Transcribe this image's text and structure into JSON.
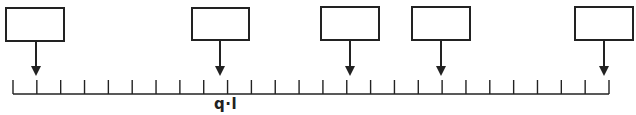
{
  "diagram": {
    "stroke_color": "#222222",
    "background": "#ffffff",
    "axis": {
      "baseline_y": 94,
      "start_x": 13,
      "end_x": 609,
      "tick_count": 26,
      "tick_top_y": 80,
      "label": "q·l",
      "label_x": 214,
      "label_y": 95
    },
    "boxes": [
      {
        "x": 5,
        "y": 7,
        "w": 60,
        "h": 35,
        "arrow_x": 36
      },
      {
        "x": 191,
        "y": 7,
        "w": 59,
        "h": 34,
        "arrow_x": 220
      },
      {
        "x": 320,
        "y": 6,
        "w": 60,
        "h": 35,
        "arrow_x": 350
      },
      {
        "x": 411,
        "y": 6,
        "w": 60,
        "h": 35,
        "arrow_x": 441
      },
      {
        "x": 574,
        "y": 6,
        "w": 60,
        "h": 35,
        "arrow_x": 604
      }
    ],
    "arrow_tip_y": 76
  }
}
